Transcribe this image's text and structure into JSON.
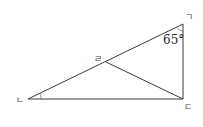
{
  "diagram": {
    "type": "geometry-triangle",
    "vertices": {
      "giyeok": {
        "label": "ㄱ",
        "x": 183,
        "y": 24
      },
      "nieun": {
        "label": "ㄴ",
        "x": 28,
        "y": 99
      },
      "digeut": {
        "label": "ㄷ",
        "x": 183,
        "y": 99
      },
      "rieul": {
        "label": "ㄹ",
        "x": 106,
        "y": 62
      }
    },
    "segments": [
      {
        "from": "giyeok",
        "to": "nieun"
      },
      {
        "from": "nieun",
        "to": "digeut"
      },
      {
        "from": "digeut",
        "to": "giyeok"
      },
      {
        "from": "rieul",
        "to": "digeut"
      }
    ],
    "angles": [
      {
        "vertex": "giyeok",
        "label": "65°"
      },
      {
        "vertex": "nieun",
        "label": ""
      }
    ],
    "colors": {
      "line": "#3a3a3a",
      "text": "#222222",
      "background": "#ffffff"
    }
  }
}
